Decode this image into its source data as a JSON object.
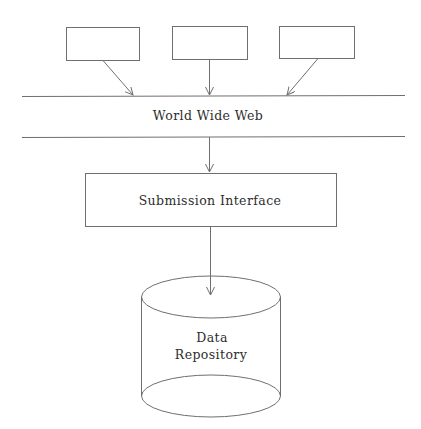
{
  "diagram": {
    "clients": [
      {
        "label": ""
      },
      {
        "label": ""
      },
      {
        "label": ""
      }
    ],
    "network": {
      "label": "World Wide Web"
    },
    "interface": {
      "label": "Submission Interface"
    },
    "repository": {
      "line1": "Data",
      "line2": "Repository"
    },
    "colors": {
      "stroke": "#6f6f6f",
      "text": "#2e2e2e",
      "background": "#ffffff"
    }
  }
}
